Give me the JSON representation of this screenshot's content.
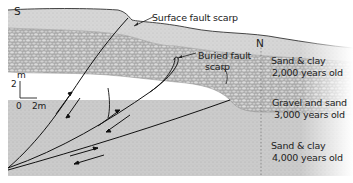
{
  "diagram": {
    "type": "geologic-cross-section",
    "orientation": {
      "left": "S",
      "right": "N"
    },
    "callouts": {
      "surface_fault_scarp": "Surface fault scarp",
      "buried_fault_scarp_line1": "Buried fault",
      "buried_fault_scarp_line2": "scarp"
    },
    "layers": [
      {
        "name_line": "Sand & clay",
        "age_line": "2,000 years old",
        "texture": "fine",
        "color": "#d9d9d9"
      },
      {
        "name_line": "Gravel and sand",
        "age_line": "3,000 years old",
        "texture": "gravel",
        "color": "#b9b9b9"
      },
      {
        "name_line": "Sand & clay",
        "age_line": "4,000 years old",
        "texture": "fine",
        "color": "#cdcdcd"
      }
    ],
    "scale": {
      "vertical_unit": "m",
      "vertical_value": "2",
      "origin": "0",
      "horizontal_value": "2m"
    },
    "faults": {
      "count": 3,
      "motion_arrows": "paired half-arrows indicating reverse/thrust slip"
    }
  }
}
